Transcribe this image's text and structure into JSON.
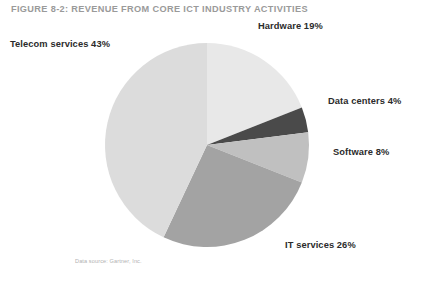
{
  "figure": {
    "title": "FIGURE 8-2: REVENUE FROM CORE ICT INDUSTRY ACTIVITIES",
    "source_note": "Data source: Gartner, Inc.",
    "title_color": "#9a9a9a",
    "label_color": "#2b2b2b",
    "source_color": "#b2b2b2",
    "background": "#ffffff"
  },
  "labels": {
    "hardware": "Hardware 19%",
    "telecom": "Telecom services 43%",
    "data_centers": "Data centers 4%",
    "software": "Software 8%",
    "it_services": "IT services 26%"
  },
  "chart_data": {
    "type": "pie",
    "title": "FIGURE 8-2: REVENUE FROM CORE ICT INDUSTRY ACTIVITIES",
    "xlabel": "",
    "ylabel": "",
    "legend_position": "none",
    "grid": false,
    "units": "percent",
    "start_angle_deg": 0,
    "direction": "clockwise",
    "categories": [
      "Hardware",
      "Data centers",
      "Software",
      "IT services",
      "Telecom services"
    ],
    "values": [
      19,
      4,
      8,
      26,
      43
    ],
    "labels": [
      "Hardware 19%",
      "Data centers 4%",
      "Software 8%",
      "IT services 26%",
      "Telecom services 43%"
    ],
    "colors": [
      "#e8e8e8",
      "#4a4a4a",
      "#c0c0c0",
      "#a3a3a3",
      "#dcdcdc"
    ],
    "slices": [
      {
        "name": "Hardware",
        "value": 19,
        "label": "Hardware 19%",
        "color": "#e8e8e8",
        "start_deg": 0,
        "end_deg": 68.4,
        "label_pos": "top-right"
      },
      {
        "name": "Data centers",
        "value": 4,
        "label": "Data centers 4%",
        "color": "#4a4a4a",
        "start_deg": 68.4,
        "end_deg": 82.8,
        "label_pos": "right"
      },
      {
        "name": "Software",
        "value": 8,
        "label": "Software 8%",
        "color": "#c0c0c0",
        "start_deg": 82.8,
        "end_deg": 111.6,
        "label_pos": "right"
      },
      {
        "name": "IT services",
        "value": 26,
        "label": "IT services 26%",
        "color": "#a3a3a3",
        "start_deg": 111.6,
        "end_deg": 205.2,
        "label_pos": "bottom-right"
      },
      {
        "name": "Telecom services",
        "value": 43,
        "label": "Telecom services 43%",
        "color": "#dcdcdc",
        "start_deg": 205.2,
        "end_deg": 360,
        "label_pos": "top-left"
      }
    ],
    "geometry": {
      "center_x": 207,
      "center_y": 145,
      "radius": 102
    },
    "annotations": [
      "Data source: Gartner, Inc."
    ]
  }
}
